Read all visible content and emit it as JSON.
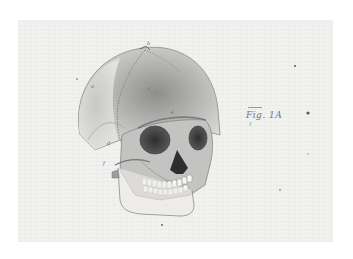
{
  "image": {
    "subject": "anatomical drawing of a human skull, three-quarter view",
    "caption": "Fig. 1A",
    "caption_sub": "ℓ",
    "colors": {
      "paper": "#f1f1f0",
      "bone_light": "#d9d9d8",
      "bone_mid": "#a9a9a8",
      "bone_dark": "#3e3e3e",
      "ink": "#6a6a6a"
    },
    "labels": [
      "a",
      "b",
      "c",
      "d",
      "e",
      "f"
    ]
  }
}
